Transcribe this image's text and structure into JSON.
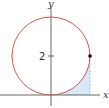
{
  "diagram": {
    "axes": {
      "x_label": "x",
      "y_label": "y",
      "tick_label": "2"
    },
    "circle": {
      "center": [
        0,
        2
      ],
      "radius": 2,
      "stroke_color": "#d9534f"
    },
    "point": {
      "coords": [
        2,
        2
      ],
      "color": "#111111"
    },
    "shaded_region": {
      "fill_color": "#cfe6f5",
      "description": "region between circle arc and x-axis from x=0 to x=2"
    },
    "dashed_line": {
      "from": [
        2,
        2
      ],
      "to": [
        2,
        0
      ],
      "color": "#7fb3d5"
    }
  }
}
